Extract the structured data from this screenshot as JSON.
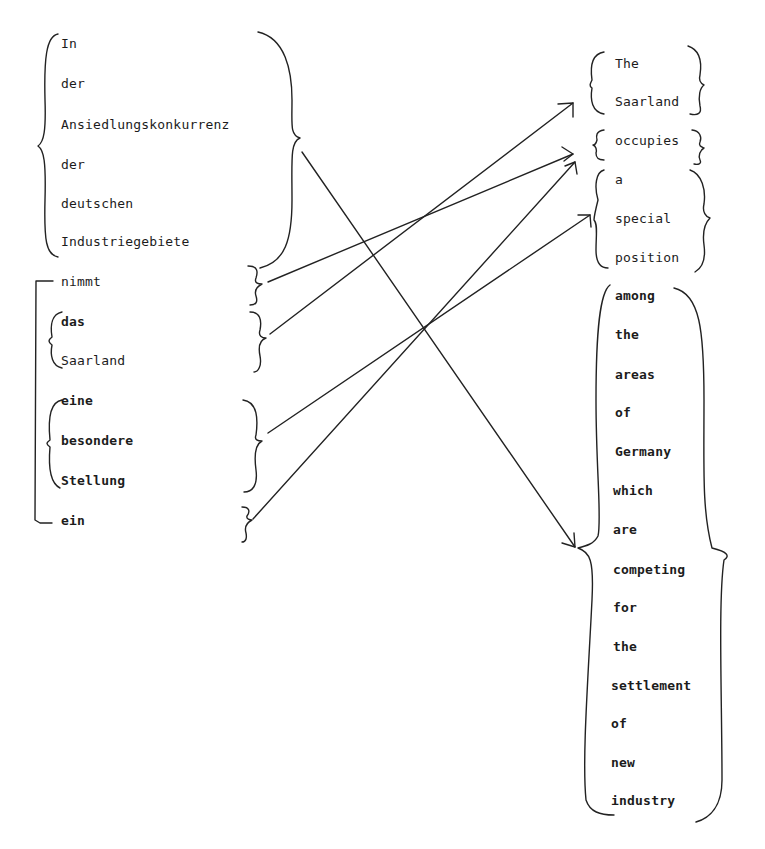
{
  "german": {
    "prepositional_phrase": [
      "In",
      "der",
      "Ansiedlungskonkurrenz",
      "der",
      "deutschen",
      "Industriegebiete"
    ],
    "verb_part1": "nimmt",
    "subject": [
      "das",
      "Saarland"
    ],
    "object": [
      "eine",
      "besondere",
      "Stellung"
    ],
    "verb_part2": "ein"
  },
  "english": {
    "subject": [
      "The",
      "Saarland"
    ],
    "verb": "occupies",
    "object": [
      "a",
      "special",
      "position"
    ],
    "prepositional_phrase": [
      "among",
      "the",
      "areas",
      "of",
      "Germany",
      "which",
      "are",
      "competing",
      "for",
      "the",
      "settlement",
      "of",
      "new",
      "industry"
    ]
  },
  "mappings": [
    {
      "from": "In der Ansiedlungskonkurrenz der deutschen Industriegebiete",
      "to": "among the areas of Germany which are competing for the settlement of new industry"
    },
    {
      "from": "nimmt",
      "to": "occupies"
    },
    {
      "from": "das Saarland",
      "to": "The Saarland"
    },
    {
      "from": "eine besondere Stellung",
      "to": "a special position"
    },
    {
      "from": "ein",
      "to": "occupies"
    }
  ]
}
